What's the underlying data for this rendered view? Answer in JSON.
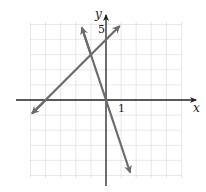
{
  "chart_data": {
    "type": "line",
    "title": "",
    "xlabel": "x",
    "ylabel": "y",
    "xlim": [
      -5,
      5
    ],
    "ylim": [
      -5,
      5
    ],
    "grid": true,
    "tick_labels": {
      "x": [
        "1"
      ],
      "y": [
        "5"
      ]
    },
    "series": [
      {
        "name": "line-1",
        "equation": "y = x + 4",
        "points": [
          [
            -4.9,
            -0.9
          ],
          [
            -4,
            0
          ],
          [
            -1,
            3
          ],
          [
            0,
            4
          ],
          [
            0.9,
            4.9
          ]
        ]
      },
      {
        "name": "line-2",
        "equation": "y = -3x",
        "points": [
          [
            -1.6,
            4.8
          ],
          [
            -1,
            3
          ],
          [
            0,
            0
          ],
          [
            1.6,
            -4.8
          ]
        ]
      }
    ],
    "intersection": [
      -1,
      3
    ]
  },
  "labels": {
    "x_axis": "x",
    "y_axis": "y",
    "x_tick": "1",
    "y_tick": "5"
  },
  "colors": {
    "line": "#6b6b6b",
    "axis": "#222222",
    "grid": "#c8c8c8"
  }
}
